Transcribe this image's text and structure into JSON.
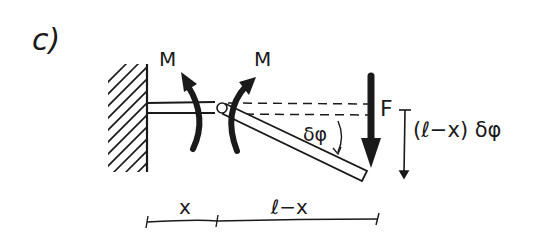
{
  "figure": {
    "panel_label": "c)",
    "moment_left_label": "M",
    "moment_right_label": "M",
    "force_label": "F",
    "angle_label": "δφ",
    "deflection_label": "(ℓ−x) δφ",
    "dimension_x_label": "x",
    "dimension_rest_label": "ℓ−x",
    "ink_color": "#1a1a1a",
    "background_color": "#ffffff"
  }
}
